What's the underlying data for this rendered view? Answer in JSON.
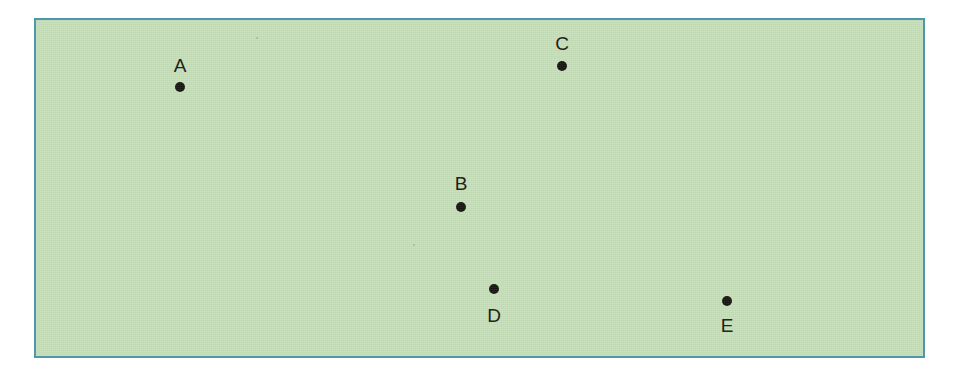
{
  "figure": {
    "type": "scatter-diagram",
    "canvas": {
      "width": 960,
      "height": 379
    },
    "background_color": "#ffffff"
  },
  "plot_frame": {
    "name": "plot-frame",
    "x": 34,
    "y": 18,
    "width": 891,
    "height": 340,
    "fill_color": "#c6dfb9",
    "border_color": "#4f97aa",
    "border_width": 2
  },
  "style": {
    "dot_color": "#16150f",
    "dot_diameter": 10,
    "label_color": "#18170f",
    "label_font_size": 19
  },
  "chart_data": {
    "type": "scatter",
    "title": "",
    "xlabel": "",
    "ylabel": "",
    "grid": false,
    "legend": "none",
    "xlim": [
      34,
      925
    ],
    "ylim": [
      18,
      358
    ],
    "labels": [
      "A",
      "B",
      "C",
      "D",
      "E"
    ],
    "points": [
      {
        "label": "A",
        "x": 180,
        "y": 87,
        "label_position": "above"
      },
      {
        "label": "B",
        "x": 461,
        "y": 207,
        "label_position": "above"
      },
      {
        "label": "C",
        "x": 562,
        "y": 66,
        "label_position": "above"
      },
      {
        "label": "D",
        "x": 494,
        "y": 289,
        "label_position": "below"
      },
      {
        "label": "E",
        "x": 727,
        "y": 301,
        "label_position": "below"
      }
    ]
  },
  "points": [
    {
      "id": "A",
      "label": "A",
      "cx": 180,
      "cy": 87,
      "label_x": 180,
      "label_y": 56,
      "label_position": "above"
    },
    {
      "id": "B",
      "label": "B",
      "cx": 461,
      "cy": 207,
      "label_x": 461,
      "label_y": 174,
      "label_position": "above"
    },
    {
      "id": "C",
      "label": "C",
      "cx": 562,
      "cy": 66,
      "label_x": 562,
      "label_y": 34,
      "label_position": "above"
    },
    {
      "id": "D",
      "label": "D",
      "cx": 494,
      "cy": 289,
      "label_x": 494,
      "label_y": 306,
      "label_position": "below"
    },
    {
      "id": "E",
      "label": "E",
      "cx": 727,
      "cy": 301,
      "label_x": 727,
      "label_y": 316,
      "label_position": "below"
    }
  ],
  "specks": [
    {
      "x": 256,
      "y": 37,
      "d": 2
    },
    {
      "x": 413,
      "y": 244,
      "d": 2
    }
  ]
}
